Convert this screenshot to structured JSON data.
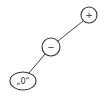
{
  "diagram": {
    "type": "expression-tree",
    "nodes": [
      {
        "id": "plus",
        "label": "+",
        "shape": "circle",
        "cx": 89,
        "cy": 15,
        "r": 8
      },
      {
        "id": "minus",
        "label": "−",
        "shape": "circle",
        "cx": 51,
        "cy": 47,
        "r": 9
      },
      {
        "id": "zero",
        "label": "„0“",
        "shape": "ellipse",
        "cx": 23,
        "cy": 81,
        "rx": 13,
        "ry": 9
      }
    ],
    "edges": [
      {
        "from": "plus",
        "to": "minus"
      },
      {
        "from": "minus",
        "to": "zero"
      }
    ]
  }
}
